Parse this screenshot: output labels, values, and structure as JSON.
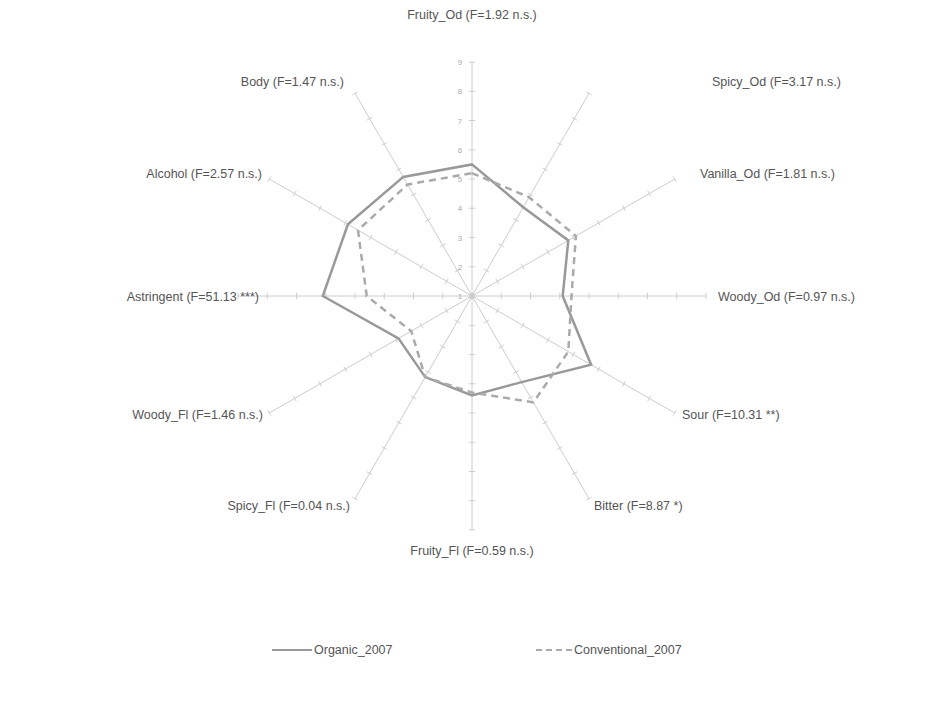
{
  "chart_data": {
    "type": "radar",
    "title": "",
    "axis_range": [
      1,
      9
    ],
    "ticks": [
      1,
      2,
      3,
      4,
      5,
      6,
      7,
      8,
      9
    ],
    "grid": "spokes-only",
    "legend_position": "bottom",
    "categories": [
      "Fruity_Od (F=1.92 n.s.)",
      "Spicy_Od (F=3.17 n.s.)",
      "Vanilla_Od (F=1.81 n.s.)",
      "Woody_Od (F=0.97 n.s.)",
      "Sour (F=10.31 **)",
      "Bitter (F=8.87 *)",
      "Fruity_Fl (F=0.59 n.s.)",
      "Spicy_Fl (F=0.04 n.s.)",
      "Woody_Fl (F=1.46 n.s.)",
      "Astringent (F=51.13 ***)",
      "Alcohol (F=2.57 n.s.)",
      "Body (F=1.47 n.s.)"
    ],
    "series": [
      {
        "name": "Organic_2007",
        "style": "solid",
        "color": "#999999",
        "values": [
          5.5,
          4.5,
          4.8,
          4.1,
          5.7,
          4.4,
          4.4,
          4.2,
          3.9,
          6.1,
          5.9,
          5.7
        ]
      },
      {
        "name": "Conventional_2007",
        "style": "dashed",
        "color": "#aaaaaa",
        "values": [
          5.2,
          4.9,
          5.1,
          4.4,
          4.8,
          5.2,
          4.3,
          4.2,
          3.4,
          4.6,
          5.5,
          5.4
        ]
      }
    ]
  },
  "legend": {
    "organic": "Organic_2007",
    "conventional": "Conventional_2007"
  }
}
